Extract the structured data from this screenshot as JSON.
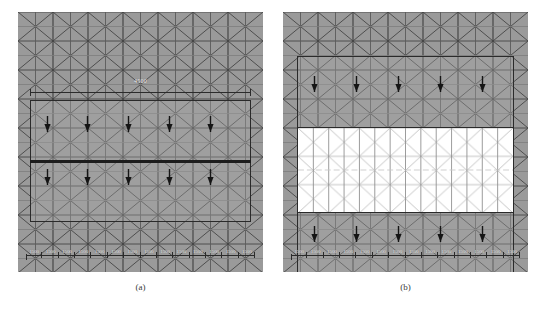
{
  "figure": {
    "panels": [
      {
        "id": "a",
        "caption": "(a)",
        "mesh": {
          "background_color": "#9a9a9a",
          "line_color": "#4a4a4a",
          "type": "triangular",
          "columns": 14,
          "rows": 9
        },
        "top_dimension": {
          "label": "4500",
          "visible": true
        },
        "regions": [
          {
            "name": "loaded-strip-upper",
            "fill": "shaded",
            "loads": 5
          },
          {
            "name": "loaded-strip-lower",
            "fill": "shaded",
            "loads": 5
          }
        ],
        "load_arrows": {
          "direction": "down",
          "upper_row_count": 5,
          "lower_row_count": 5,
          "color": "#1a1a1a"
        },
        "bottom_dimension_chain": {
          "labels": [
            "1500",
            "1500",
            "1500",
            "1500",
            "1500",
            "1500",
            "1500",
            "1500",
            "1500",
            "1500",
            "1500",
            "1500",
            "1500",
            "1500"
          ]
        }
      },
      {
        "id": "b",
        "caption": "(b)",
        "mesh": {
          "background_color": "#9a9a9a",
          "line_color": "#4a4a4a",
          "type": "triangular",
          "columns": 14,
          "rows": 9
        },
        "top_dimension": {
          "label": "",
          "visible": false
        },
        "regions": [
          {
            "name": "loaded-strip-upper",
            "fill": "shaded",
            "loads": 5
          },
          {
            "name": "highlighted-core",
            "fill": "white",
            "loads": 0
          },
          {
            "name": "loaded-strip-lower",
            "fill": "shaded",
            "loads": 5
          }
        ],
        "load_arrows": {
          "direction": "down",
          "upper_row_count": 5,
          "lower_row_count": 5,
          "color": "#1a1a1a"
        },
        "bottom_dimension_chain": {
          "labels": [
            "1500",
            "1500",
            "1500",
            "1500",
            "1500",
            "1500",
            "1500",
            "1500",
            "1500",
            "1500",
            "1500",
            "1500",
            "1500",
            "1500"
          ]
        }
      }
    ]
  }
}
